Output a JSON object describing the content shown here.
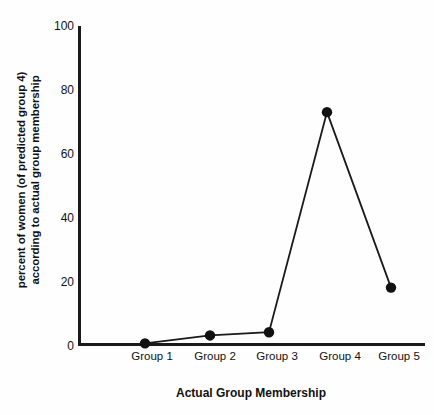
{
  "chart_data": {
    "type": "line",
    "title": "",
    "xlabel": "Actual Group Membership",
    "ylabel_line1": "percent of women (of predicted group 4)",
    "ylabel_line2": "according to actual group membership",
    "categories": [
      "Group 1",
      "Group 2",
      "Group 3",
      "Group 4",
      "Group 5"
    ],
    "values": [
      0.5,
      3,
      4,
      73,
      18
    ],
    "series": [
      {
        "name": "percent of women of predicted group 4",
        "values": [
          0.5,
          3,
          4,
          73,
          18
        ]
      }
    ],
    "ylim": [
      0,
      100
    ],
    "yticks": [
      0,
      20,
      40,
      60,
      80,
      100
    ],
    "ytick_labels": [
      "0",
      "20",
      "40",
      "60",
      "80",
      "100"
    ],
    "grid": false,
    "legend": "none",
    "marker": "filled-circle",
    "line_color": "#1a1a1a",
    "marker_color": "#111111",
    "axis_color": "#1a1a1a",
    "background_color": "#fefefe"
  }
}
